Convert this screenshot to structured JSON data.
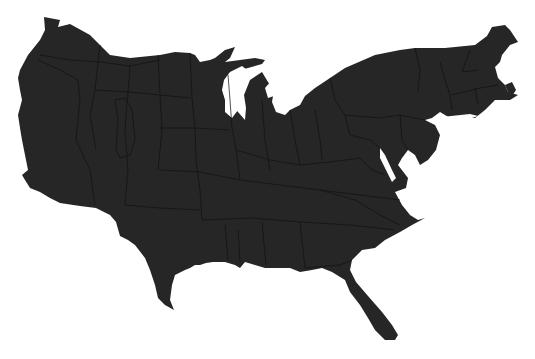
{
  "map": {
    "title": "Cartogram of the contiguous United States",
    "fill_color": "#262626",
    "border_color": "#111111",
    "background_color": "#ffffff",
    "lake_color": "#ffffff",
    "labels_visible": false
  }
}
